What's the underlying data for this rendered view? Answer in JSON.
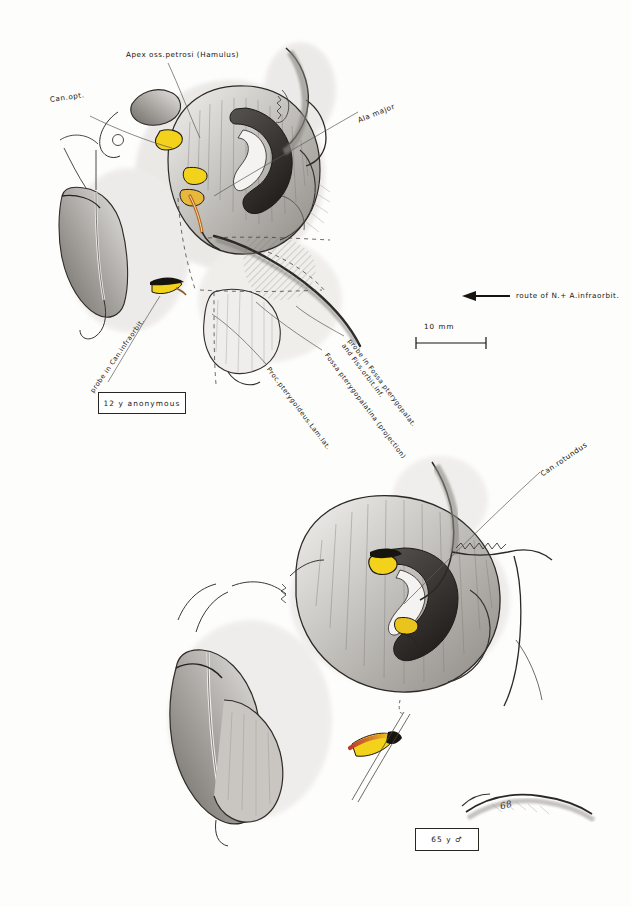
{
  "figure": {
    "title_implied": "Anatomical pencil drawing: pterygopalatine fossa and infraorbital canal, two skull specimens",
    "medium": "pencil and colored-pencil anatomical illustration on white paper",
    "signature": "68"
  },
  "colors": {
    "paper": "#fdfdfc",
    "ink": "#17140f",
    "pencil_mid": "#8a8680",
    "pencil_light": "#c8c5bf",
    "highlight_yellow": "#f2d21a",
    "probe_orange": "#d4762c",
    "probe_red": "#c0392b",
    "leader_line": "#5d5853"
  },
  "upper_figure": {
    "specimen_box": "12 y anonymous",
    "labels": [
      {
        "id": "apex-oss-petrosi",
        "text": "Apex oss.petrosi (Hamulus)",
        "rotation": 0
      },
      {
        "id": "can-opt",
        "text": "Can.opt.",
        "rotation": 0
      },
      {
        "id": "ala-major",
        "text": "Ala major",
        "rotation": -22
      },
      {
        "id": "probe-can-infraorbit",
        "text": "probe in Can.infraorbit.",
        "rotation": -55
      },
      {
        "id": "probe-fossa-pterygopalat",
        "text": "probe in Fossa pterygopalat.\nand Fiss.orbit.inf.",
        "rotation": 53
      },
      {
        "id": "fossa-pterygopalatina",
        "text": "Fossa pterygopalatina (projection)",
        "rotation": 53
      },
      {
        "id": "proc-pterygoideus",
        "text": "Proc.pterygoideus.Lam.lat.",
        "rotation": 53
      }
    ]
  },
  "lower_figure": {
    "specimen_box": "65 y ♂",
    "labels": [
      {
        "id": "can-rotundus",
        "text": "Can.rotundus",
        "rotation": -34
      }
    ]
  },
  "legend": {
    "route_label": "route of N.+ A.infraorbit.",
    "route_arrow": "left-arrow-icon",
    "scale_value": "10  mm",
    "scale_bar_length_px": 70
  }
}
